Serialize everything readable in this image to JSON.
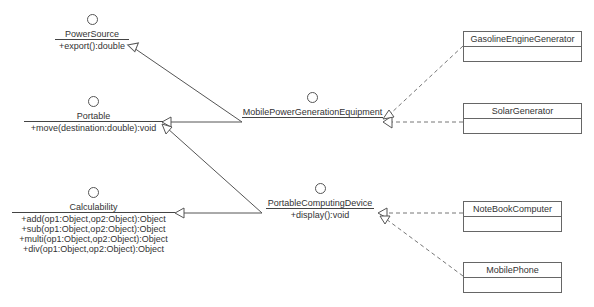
{
  "interfaces": {
    "power_source": {
      "name": "PowerSource",
      "operations": [
        "+export():double"
      ]
    },
    "portable": {
      "name": "Portable",
      "operations": [
        "+move(destination:double):void"
      ]
    },
    "calculability": {
      "name": "Calculability",
      "operations": [
        "+add(op1:Object,op2:Object):Object",
        "+sub(op1:Object,op2:Object):Object",
        "+multi(op1:Object,op2:Object):Object",
        "+div(op1:Object,op2:Object):Object"
      ]
    },
    "mobile_power_generation_equipment": {
      "name": "MobilePowerGenerationEquipment",
      "operations": []
    },
    "portable_computing_device": {
      "name": "PortableComputingDevice",
      "operations": [
        "+display():void"
      ]
    }
  },
  "classes": {
    "gasoline_engine_generator": {
      "name": "GasolineEngineGenerator"
    },
    "solar_generator": {
      "name": "SolarGenerator"
    },
    "notebook_computer": {
      "name": "NoteBookComputer"
    },
    "mobile_phone": {
      "name": "MobilePhone"
    }
  },
  "relationships": [
    {
      "from": "MobilePowerGenerationEquipment",
      "to": "PowerSource",
      "type": "generalization"
    },
    {
      "from": "MobilePowerGenerationEquipment",
      "to": "Portable",
      "type": "generalization"
    },
    {
      "from": "PortableComputingDevice",
      "to": "Portable",
      "type": "generalization"
    },
    {
      "from": "PortableComputingDevice",
      "to": "Calculability",
      "type": "generalization"
    },
    {
      "from": "GasolineEngineGenerator",
      "to": "MobilePowerGenerationEquipment",
      "type": "realization"
    },
    {
      "from": "SolarGenerator",
      "to": "MobilePowerGenerationEquipment",
      "type": "realization"
    },
    {
      "from": "NoteBookComputer",
      "to": "PortableComputingDevice",
      "type": "realization"
    },
    {
      "from": "MobilePhone",
      "to": "PortableComputingDevice",
      "type": "realization"
    }
  ]
}
